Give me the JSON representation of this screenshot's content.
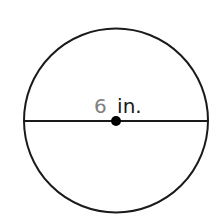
{
  "diagram": {
    "shape": "circle",
    "diameter_label": {
      "number": "6",
      "unit": "in."
    },
    "colors": {
      "stroke": "#1a1a1a",
      "number": "#808080",
      "unit": "#1a1a1a",
      "background": "#ffffff"
    }
  }
}
